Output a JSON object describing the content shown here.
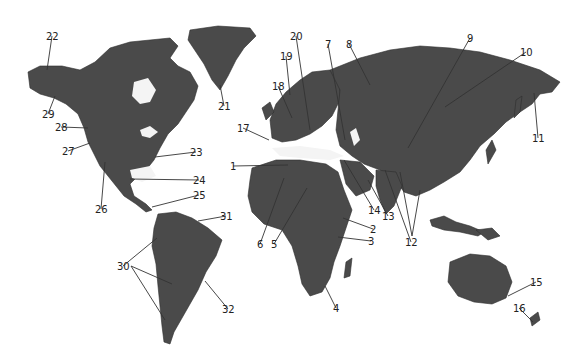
{
  "figure": {
    "type": "world relief map with numbered landform labels",
    "background": "#ffffff",
    "land_color": "#4a4a4a"
  },
  "labels": [
    {
      "id": "1",
      "text": "1",
      "x": 230,
      "y": 170,
      "tx": 288,
      "ty": 165
    },
    {
      "id": "2",
      "text": "2",
      "x": 370,
      "y": 233,
      "tx": 343,
      "ty": 218
    },
    {
      "id": "3",
      "text": "3",
      "x": 368,
      "y": 245,
      "tx": 338,
      "ty": 237
    },
    {
      "id": "4",
      "text": "4",
      "x": 333,
      "y": 312,
      "tx": 325,
      "ty": 286
    },
    {
      "id": "5",
      "text": "5",
      "x": 271,
      "y": 248,
      "tx": 307,
      "ty": 188
    },
    {
      "id": "6",
      "text": "6",
      "x": 257,
      "y": 248,
      "tx": 284,
      "ty": 178
    },
    {
      "id": "7",
      "text": "7",
      "x": 325,
      "y": 48,
      "tx": 345,
      "ty": 140
    },
    {
      "id": "8",
      "text": "8",
      "x": 346,
      "y": 48,
      "tx": 370,
      "ty": 85
    },
    {
      "id": "9",
      "text": "9",
      "x": 467,
      "y": 42,
      "tx": 408,
      "ty": 148
    },
    {
      "id": "10",
      "text": "10",
      "x": 520,
      "y": 56,
      "tx": 445,
      "ty": 107
    },
    {
      "id": "11",
      "text": "11",
      "x": 532,
      "y": 142,
      "tx": 534,
      "ty": 93
    },
    {
      "id": "12",
      "text": "12",
      "x": 405,
      "y": 246,
      "tx": 385,
      "ty": 170
    },
    {
      "id": "13",
      "text": "13",
      "x": 382,
      "y": 220,
      "tx": 368,
      "ty": 180
    },
    {
      "id": "14",
      "text": "14",
      "x": 368,
      "y": 214,
      "tx": 344,
      "ty": 160
    },
    {
      "id": "15",
      "text": "15",
      "x": 530,
      "y": 286,
      "tx": 508,
      "ty": 296
    },
    {
      "id": "16",
      "text": "16",
      "x": 513,
      "y": 312,
      "tx": 533,
      "ty": 322
    },
    {
      "id": "17",
      "text": "17",
      "x": 237,
      "y": 132,
      "tx": 269,
      "ty": 140
    },
    {
      "id": "18",
      "text": "18",
      "x": 272,
      "y": 90,
      "tx": 292,
      "ty": 118
    },
    {
      "id": "19",
      "text": "19",
      "x": 280,
      "y": 60,
      "tx": 290,
      "ty": 95
    },
    {
      "id": "20",
      "text": "20",
      "x": 290,
      "y": 40,
      "tx": 310,
      "ty": 130
    },
    {
      "id": "21",
      "text": "21",
      "x": 218,
      "y": 110,
      "tx": 220,
      "ty": 85
    },
    {
      "id": "22",
      "text": "22",
      "x": 46,
      "y": 40,
      "tx": 47,
      "ty": 70
    },
    {
      "id": "23",
      "text": "23",
      "x": 190,
      "y": 156,
      "tx": 155,
      "ty": 157
    },
    {
      "id": "24",
      "text": "24",
      "x": 193,
      "y": 184,
      "tx": 130,
      "ty": 179
    },
    {
      "id": "25",
      "text": "25",
      "x": 193,
      "y": 199,
      "tx": 152,
      "ty": 207
    },
    {
      "id": "26",
      "text": "26",
      "x": 95,
      "y": 213,
      "tx": 105,
      "ty": 162
    },
    {
      "id": "27",
      "text": "27",
      "x": 62,
      "y": 155,
      "tx": 90,
      "ty": 143
    },
    {
      "id": "28",
      "text": "28",
      "x": 55,
      "y": 131,
      "tx": 88,
      "ty": 128
    },
    {
      "id": "29",
      "text": "29",
      "x": 42,
      "y": 118,
      "tx": 55,
      "ty": 96
    },
    {
      "id": "30",
      "text": "30",
      "x": 117,
      "y": 270,
      "tx": 157,
      "ty": 238
    },
    {
      "id": "31",
      "text": "31",
      "x": 220,
      "y": 220,
      "tx": 198,
      "ty": 221
    },
    {
      "id": "32",
      "text": "32",
      "x": 222,
      "y": 313,
      "tx": 205,
      "ty": 281
    }
  ],
  "extra_leaders": [
    {
      "for": "30",
      "x1": 131,
      "y1": 266,
      "x2": 172,
      "y2": 284
    },
    {
      "for": "30",
      "x1": 131,
      "y1": 266,
      "x2": 165,
      "y2": 320
    },
    {
      "for": "12",
      "x1": 412,
      "y1": 236,
      "x2": 400,
      "y2": 172
    },
    {
      "for": "12",
      "x1": 412,
      "y1": 236,
      "x2": 420,
      "y2": 190
    }
  ]
}
